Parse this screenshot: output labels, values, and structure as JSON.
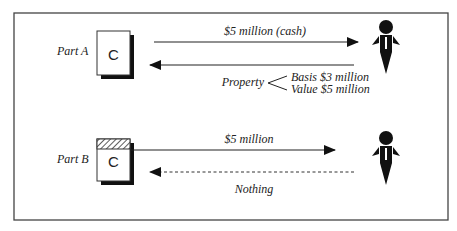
{
  "diagram": {
    "part_a": {
      "label": "Part A",
      "entity_letter": "C",
      "arrow_to_person": "$5 million (cash)",
      "arrow_from_person": "Property",
      "property_details": [
        "Basis $3 million",
        "Value $5 million"
      ]
    },
    "part_b": {
      "label": "Part B",
      "entity_letter": "C",
      "arrow_to_person": "$5 million",
      "arrow_from_person": "Nothing"
    }
  }
}
